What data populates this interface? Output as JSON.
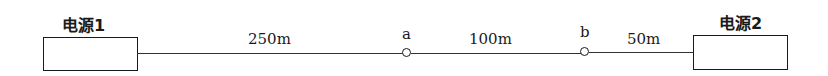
{
  "diagram": {
    "type": "single-line power distribution",
    "sources": [
      {
        "id": "source-1",
        "label": "电源1"
      },
      {
        "id": "source-2",
        "label": "电源2"
      }
    ],
    "nodes": [
      {
        "id": "a",
        "label": "a"
      },
      {
        "id": "b",
        "label": "b"
      }
    ],
    "segments": [
      {
        "from": "电源1",
        "to": "a",
        "length": "250m"
      },
      {
        "from": "a",
        "to": "b",
        "length": "100m"
      },
      {
        "from": "b",
        "to": "电源2",
        "length": "50m"
      }
    ]
  }
}
